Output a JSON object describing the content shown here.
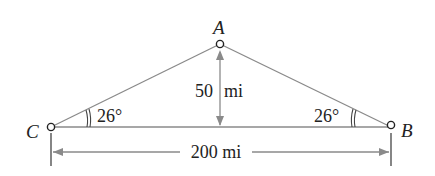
{
  "diagram": {
    "type": "triangle",
    "vertices": {
      "A": {
        "label": "A",
        "x": 220,
        "y": 44
      },
      "B": {
        "label": "B",
        "x": 391,
        "y": 127
      },
      "C": {
        "label": "C",
        "x": 51,
        "y": 127
      }
    },
    "angles": {
      "C": {
        "label": "26°"
      },
      "B": {
        "label": "26°"
      }
    },
    "dimensions": {
      "height": {
        "label": "50 mi"
      },
      "base": {
        "label": "200 mi"
      }
    },
    "colors": {
      "line": "#8a8a8a",
      "text": "#222222",
      "point_stroke": "#222222"
    }
  }
}
